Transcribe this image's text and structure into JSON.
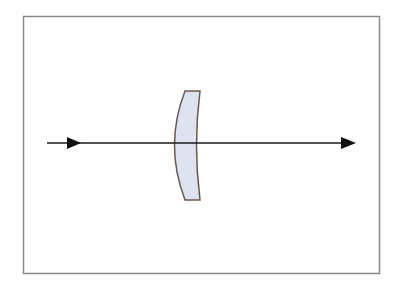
{
  "diagram": {
    "title": "",
    "colors": {
      "frame": "#8a8a8a",
      "ray": "#1a1a1a",
      "lens_fill": "#dde3f1",
      "lens_stroke": "#6b5a4a"
    },
    "elements": [
      {
        "id": "frame",
        "type": "rectangle"
      },
      {
        "id": "ray",
        "type": "arrow-line",
        "direction": "left-to-right"
      },
      {
        "id": "lens",
        "type": "meniscus-lens"
      }
    ]
  }
}
